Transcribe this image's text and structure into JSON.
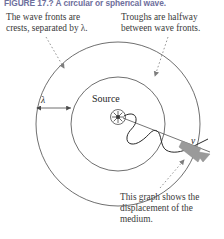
{
  "figure": {
    "caption_label": "FIGURE 17.?",
    "caption_text": "A circular or spherical wave.",
    "caption_full": "FIGURE 17.? A circular or spherical wave."
  },
  "annotations": {
    "top_left": "The wave fronts are\ncrests, separated by λ.",
    "top_right": "Troughs are halfway\nbetween wave fronts.",
    "bottom_right": "This graph shows the\ndisplacement of the\nmedium."
  },
  "diagram": {
    "source_label": "Source",
    "wavelength_label": "λ",
    "velocity_label": "v",
    "source_icon": "starburst-icon",
    "wave_front_count": 2,
    "leader_line_style": "dotted"
  },
  "colors": {
    "background": "#ffffff",
    "caption": "#6e6f9c",
    "text": "#3a3a3a",
    "stroke": "#4a4a4a",
    "wave_stroke": "#2a2a2a",
    "velocity_arrow": "#9a9a9a",
    "leader": "#8a8a8a"
  }
}
